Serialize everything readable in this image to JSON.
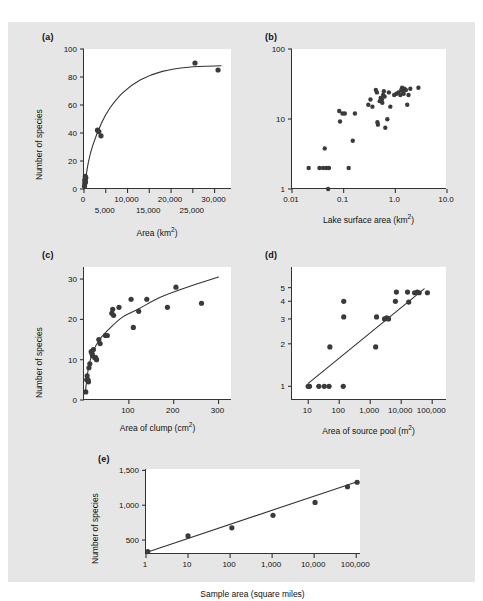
{
  "figure": {
    "background": "#e6e6e6",
    "panel_background": "#ffffff",
    "ink": "#333333",
    "marker_color": "#3a3a3a"
  },
  "panels": {
    "a": {
      "label": "(a)",
      "ylabel": "Number of species",
      "xlabel_main": "Area (km",
      "xlabel_sup": "2",
      "xlabel_tail": ")"
    },
    "b": {
      "label": "(b)",
      "ylabel": "",
      "xlabel_main": "Lake surface area (km",
      "xlabel_sup": "2",
      "xlabel_tail": ")"
    },
    "c": {
      "label": "(c)",
      "ylabel": "Number of species",
      "xlabel_main": "Area of clump (cm",
      "xlabel_sup": "2",
      "xlabel_tail": ")"
    },
    "d": {
      "label": "(d)",
      "ylabel": "",
      "xlabel_main": "Area of source pool (m",
      "xlabel_sup": "2",
      "xlabel_tail": ")"
    },
    "e": {
      "label": "(e)",
      "ylabel": "Number of species",
      "xlabel_main": "Sample area (square miles)",
      "xlabel_sup": "",
      "xlabel_tail": ""
    }
  },
  "chart_data": [
    {
      "id": "a",
      "type": "scatter",
      "title": "(a)",
      "xlabel": "Area (km2)",
      "ylabel": "Number of species",
      "xscale": "linear",
      "yscale": "linear",
      "xlim": [
        0,
        34000
      ],
      "ylim": [
        0,
        100
      ],
      "yticks": [
        0,
        20,
        40,
        60,
        80,
        100
      ],
      "ytick_labels": [
        "0",
        "20",
        "40",
        "60",
        "80",
        "100"
      ],
      "xticks": [
        0,
        5000,
        10000,
        15000,
        20000,
        25000,
        30000
      ],
      "xtick_labels": [
        "0",
        "5,000",
        "10,000",
        "15,000",
        "20,000",
        "25,000",
        "30,000"
      ],
      "xtick_rows": [
        0,
        1,
        0,
        1,
        0,
        1,
        0
      ],
      "grid": false,
      "legend": "none",
      "points": [
        {
          "x": 120,
          "y": 2
        },
        {
          "x": 180,
          "y": 4
        },
        {
          "x": 200,
          "y": 6
        },
        {
          "x": 260,
          "y": 7
        },
        {
          "x": 300,
          "y": 9
        },
        {
          "x": 340,
          "y": 5
        },
        {
          "x": 420,
          "y": 8
        },
        {
          "x": 3100,
          "y": 42
        },
        {
          "x": 3400,
          "y": 41
        },
        {
          "x": 3900,
          "y": 38
        },
        {
          "x": 25500,
          "y": 90
        },
        {
          "x": 30800,
          "y": 85
        }
      ],
      "fit_curve": {
        "form": "saturating",
        "description": "Smooth rising curve saturating near 88 species",
        "points": [
          {
            "x": 0,
            "y": 0
          },
          {
            "x": 1000,
            "y": 19
          },
          {
            "x": 2000,
            "y": 31
          },
          {
            "x": 4000,
            "y": 47
          },
          {
            "x": 6000,
            "y": 58
          },
          {
            "x": 9000,
            "y": 69
          },
          {
            "x": 13000,
            "y": 78
          },
          {
            "x": 18000,
            "y": 84
          },
          {
            "x": 24000,
            "y": 87
          },
          {
            "x": 31500,
            "y": 88
          }
        ]
      }
    },
    {
      "id": "b",
      "type": "scatter",
      "title": "(b)",
      "xlabel": "Lake surface area (km2)",
      "ylabel": "",
      "xscale": "log",
      "yscale": "log",
      "xlim": [
        0.01,
        10.0
      ],
      "ylim": [
        1,
        100
      ],
      "yticks": [
        1,
        10,
        100
      ],
      "ytick_labels": [
        "1",
        "10",
        "100"
      ],
      "xticks": [
        0.01,
        0.1,
        1.0,
        10.0
      ],
      "xtick_labels": [
        "0.01",
        "0.1",
        "1.0",
        "10.0"
      ],
      "grid": false,
      "legend": "none",
      "points": [
        {
          "x": 0.021,
          "y": 2
        },
        {
          "x": 0.034,
          "y": 2
        },
        {
          "x": 0.04,
          "y": 2
        },
        {
          "x": 0.046,
          "y": 2
        },
        {
          "x": 0.052,
          "y": 2
        },
        {
          "x": 0.05,
          "y": 1
        },
        {
          "x": 0.043,
          "y": 3.8
        },
        {
          "x": 0.082,
          "y": 13
        },
        {
          "x": 0.085,
          "y": 9.2
        },
        {
          "x": 0.095,
          "y": 12
        },
        {
          "x": 0.105,
          "y": 12
        },
        {
          "x": 0.125,
          "y": 2
        },
        {
          "x": 0.15,
          "y": 4.9
        },
        {
          "x": 0.165,
          "y": 12
        },
        {
          "x": 0.3,
          "y": 16
        },
        {
          "x": 0.33,
          "y": 19
        },
        {
          "x": 0.36,
          "y": 15
        },
        {
          "x": 0.42,
          "y": 26
        },
        {
          "x": 0.44,
          "y": 24
        },
        {
          "x": 0.45,
          "y": 9.0
        },
        {
          "x": 0.46,
          "y": 8.3
        },
        {
          "x": 0.5,
          "y": 18
        },
        {
          "x": 0.52,
          "y": 20
        },
        {
          "x": 0.55,
          "y": 19
        },
        {
          "x": 0.56,
          "y": 17
        },
        {
          "x": 0.58,
          "y": 22
        },
        {
          "x": 0.6,
          "y": 25
        },
        {
          "x": 0.62,
          "y": 21
        },
        {
          "x": 0.64,
          "y": 7.5
        },
        {
          "x": 0.7,
          "y": 9.9
        },
        {
          "x": 0.75,
          "y": 24
        },
        {
          "x": 0.8,
          "y": 15
        },
        {
          "x": 0.95,
          "y": 22
        },
        {
          "x": 1.05,
          "y": 23
        },
        {
          "x": 1.15,
          "y": 24
        },
        {
          "x": 1.25,
          "y": 22
        },
        {
          "x": 1.3,
          "y": 26
        },
        {
          "x": 1.35,
          "y": 28
        },
        {
          "x": 1.4,
          "y": 25
        },
        {
          "x": 1.45,
          "y": 23
        },
        {
          "x": 1.5,
          "y": 27
        },
        {
          "x": 1.6,
          "y": 26
        },
        {
          "x": 1.7,
          "y": 16
        },
        {
          "x": 1.8,
          "y": 22
        },
        {
          "x": 1.95,
          "y": 27
        },
        {
          "x": 2.8,
          "y": 28
        }
      ]
    },
    {
      "id": "c",
      "type": "scatter",
      "title": "(c)",
      "xlabel": "Area of clump (cm2)",
      "ylabel": "Number of species",
      "xscale": "linear",
      "yscale": "linear",
      "xlim": [
        0,
        330
      ],
      "ylim": [
        0,
        33
      ],
      "yticks": [
        0,
        10,
        20,
        30
      ],
      "ytick_labels": [
        "0",
        "10",
        "20",
        "30"
      ],
      "xticks": [
        100,
        200,
        300
      ],
      "xtick_labels": [
        "100",
        "200",
        "300"
      ],
      "grid": false,
      "legend": "none",
      "points": [
        {
          "x": 4,
          "y": 2
        },
        {
          "x": 6,
          "y": 5
        },
        {
          "x": 7,
          "y": 6
        },
        {
          "x": 9,
          "y": 5
        },
        {
          "x": 10,
          "y": 4.5
        },
        {
          "x": 11,
          "y": 8
        },
        {
          "x": 13,
          "y": 9
        },
        {
          "x": 16,
          "y": 12
        },
        {
          "x": 18,
          "y": 11.5
        },
        {
          "x": 19,
          "y": 11
        },
        {
          "x": 21,
          "y": 12.5
        },
        {
          "x": 24,
          "y": 10.5
        },
        {
          "x": 26,
          "y": 10.5
        },
        {
          "x": 28,
          "y": 10
        },
        {
          "x": 33,
          "y": 15
        },
        {
          "x": 36,
          "y": 14
        },
        {
          "x": 48,
          "y": 16
        },
        {
          "x": 52,
          "y": 16
        },
        {
          "x": 62,
          "y": 21.5
        },
        {
          "x": 64,
          "y": 22.5
        },
        {
          "x": 66,
          "y": 21
        },
        {
          "x": 78,
          "y": 23
        },
        {
          "x": 105,
          "y": 25
        },
        {
          "x": 110,
          "y": 18
        },
        {
          "x": 122,
          "y": 22
        },
        {
          "x": 140,
          "y": 25
        },
        {
          "x": 186,
          "y": 23
        },
        {
          "x": 205,
          "y": 28
        },
        {
          "x": 262,
          "y": 24
        }
      ],
      "fit_curve": {
        "form": "log-like",
        "description": "Rising concave curve from about 2 species to 30 species",
        "points": [
          {
            "x": 3,
            "y": 2
          },
          {
            "x": 10,
            "y": 8
          },
          {
            "x": 20,
            "y": 12
          },
          {
            "x": 35,
            "y": 15
          },
          {
            "x": 55,
            "y": 17.5
          },
          {
            "x": 85,
            "y": 20.5
          },
          {
            "x": 120,
            "y": 22.5
          },
          {
            "x": 170,
            "y": 25.5
          },
          {
            "x": 230,
            "y": 28
          },
          {
            "x": 300,
            "y": 30.5
          }
        ]
      }
    },
    {
      "id": "d",
      "type": "scatter",
      "title": "(d)",
      "xlabel": "Area of source pool (m2)",
      "ylabel": "",
      "xscale": "log",
      "yscale": "log",
      "xlim": [
        3,
        300000
      ],
      "ylim": [
        0.8,
        7
      ],
      "yticks": [
        1,
        2,
        3,
        4,
        5
      ],
      "ytick_labels": [
        "1",
        "2",
        "3",
        "4",
        "5"
      ],
      "xticks": [
        10,
        100,
        1000,
        10000,
        100000
      ],
      "xtick_labels": [
        "10",
        "100",
        "1,000",
        "10,000",
        "100,000"
      ],
      "grid": false,
      "legend": "none",
      "points": [
        {
          "x": 10,
          "y": 1
        },
        {
          "x": 11,
          "y": 1
        },
        {
          "x": 22,
          "y": 1
        },
        {
          "x": 33,
          "y": 1
        },
        {
          "x": 47,
          "y": 1
        },
        {
          "x": 50,
          "y": 1.9
        },
        {
          "x": 135,
          "y": 1
        },
        {
          "x": 140,
          "y": 4.0
        },
        {
          "x": 140,
          "y": 3.1
        },
        {
          "x": 1500,
          "y": 1.9
        },
        {
          "x": 1600,
          "y": 3.1
        },
        {
          "x": 2900,
          "y": 3.0
        },
        {
          "x": 3400,
          "y": 3.05
        },
        {
          "x": 3900,
          "y": 3.0
        },
        {
          "x": 6500,
          "y": 4.0
        },
        {
          "x": 7000,
          "y": 4.65
        },
        {
          "x": 16000,
          "y": 4.65
        },
        {
          "x": 17500,
          "y": 3.95
        },
        {
          "x": 27000,
          "y": 4.6
        },
        {
          "x": 33000,
          "y": 4.65
        },
        {
          "x": 38000,
          "y": 4.6
        },
        {
          "x": 70000,
          "y": 4.6
        }
      ],
      "fit_line": {
        "form": "linear on log-log",
        "points": [
          {
            "x": 10,
            "y": 1.05
          },
          {
            "x": 55000,
            "y": 4.9
          }
        ]
      }
    },
    {
      "id": "e",
      "type": "scatter",
      "title": "(e)",
      "xlabel": "Sample area (square miles)",
      "ylabel": "Number of species",
      "xscale": "log",
      "yscale": "linear",
      "xlim": [
        1,
        130000
      ],
      "ylim": [
        300,
        1520
      ],
      "yticks": [
        500,
        1000,
        1500
      ],
      "ytick_labels": [
        "500",
        "1,000",
        "1,500"
      ],
      "xticks": [
        1,
        10,
        100,
        1000,
        10000,
        100000
      ],
      "xtick_labels": [
        "1",
        "10",
        "100",
        "1,000",
        "10,000",
        "100,000"
      ],
      "grid": false,
      "legend": "none",
      "points": [
        {
          "x": 1.1,
          "y": 335
        },
        {
          "x": 10,
          "y": 560
        },
        {
          "x": 110,
          "y": 675
        },
        {
          "x": 1050,
          "y": 855
        },
        {
          "x": 10500,
          "y": 1040
        },
        {
          "x": 62000,
          "y": 1265
        },
        {
          "x": 105000,
          "y": 1330
        }
      ],
      "fit_line": {
        "form": "linear on semi-log",
        "points": [
          {
            "x": 1.1,
            "y": 330
          },
          {
            "x": 115000,
            "y": 1345
          }
        ]
      }
    }
  ]
}
